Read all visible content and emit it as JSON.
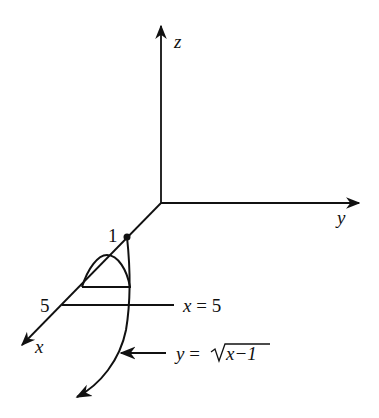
{
  "figure": {
    "axes": {
      "x_label": "x",
      "y_label": "y",
      "z_label": "z"
    },
    "point_label": "1",
    "tick_label_5": "5",
    "line_label": {
      "var": "x",
      "eq": " = ",
      "val": "5"
    },
    "curve_label": {
      "var": "y",
      "eq": " =",
      "radicand": "x−1"
    },
    "colors": {
      "stroke": "#111111",
      "background": "#ffffff"
    }
  }
}
